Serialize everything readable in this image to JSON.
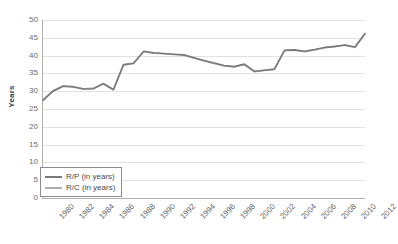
{
  "chart_data": {
    "type": "line",
    "title": "",
    "xlabel": "",
    "ylabel": "Years",
    "ylim": [
      0,
      50
    ],
    "ytick_step": 5,
    "yticks": [
      50,
      45,
      40,
      35,
      30,
      25,
      20,
      15,
      10,
      5,
      0
    ],
    "grid": true,
    "legend_position": "inside-bottom-left",
    "x": [
      1980,
      1981,
      1982,
      1983,
      1984,
      1985,
      1986,
      1987,
      1988,
      1989,
      1990,
      1991,
      1992,
      1993,
      1994,
      1995,
      1996,
      1997,
      1998,
      1999,
      2000,
      2001,
      2002,
      2003,
      2004,
      2005,
      2006,
      2007,
      2008,
      2009,
      2010,
      2011,
      2012
    ],
    "xtick_labels": [
      "1980",
      "1982",
      "1984",
      "1986",
      "1988",
      "1990",
      "1992",
      "1994",
      "1996",
      "1998",
      "2000",
      "2002",
      "2004",
      "2006",
      "2008",
      "2010",
      "2012"
    ],
    "series": [
      {
        "name": "R/P (in years)",
        "color": "#7a7a7a",
        "values": [
          27.4,
          30.0,
          31.4,
          31.2,
          30.6,
          30.7,
          32.1,
          30.4,
          37.4,
          37.8,
          41.2,
          40.8,
          40.6,
          40.4,
          40.2,
          39.4,
          38.6,
          37.9,
          37.2,
          36.9,
          37.6,
          35.6,
          35.9,
          36.2,
          41.5,
          41.6,
          41.2,
          41.7,
          42.3,
          42.6,
          43.0,
          42.4,
          46.2
        ]
      },
      {
        "name": "R/C (in years)",
        "color": "#adadad",
        "values": [
          27.6,
          30.2,
          31.5,
          31.3,
          30.7,
          30.8,
          32.2,
          30.5,
          37.5,
          37.9,
          41.1,
          40.7,
          40.5,
          40.3,
          40.1,
          39.3,
          38.5,
          37.8,
          37.1,
          36.8,
          37.5,
          35.5,
          35.8,
          36.1,
          41.4,
          41.5,
          41.1,
          41.6,
          42.2,
          42.5,
          42.9,
          42.3,
          46.1
        ]
      }
    ]
  },
  "legend": {
    "items": [
      {
        "label": "R/P (in years)"
      },
      {
        "label": "R/C (in years)"
      }
    ]
  },
  "axes": {
    "y_title": "Years"
  }
}
